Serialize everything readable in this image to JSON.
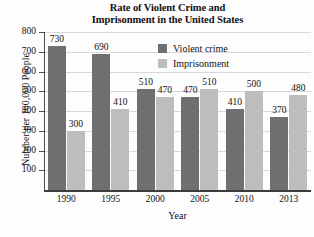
{
  "chart_data": {
    "type": "bar",
    "title": "Rate of Violent Crime and Imprisonment in the United States",
    "title_line1": "Rate of Violent Crime and",
    "title_line2": "Imprisonment in the United States",
    "xlabel": "Year",
    "ylabel": "Number per 100,000 People",
    "categories": [
      "1990",
      "1995",
      "2000",
      "2005",
      "2010",
      "2013"
    ],
    "series": [
      {
        "name": "Violent crime",
        "color": "#6f6f6f",
        "values": [
          730,
          690,
          510,
          470,
          410,
          370
        ]
      },
      {
        "name": "Imprisonment",
        "color": "#bdbdbd",
        "values": [
          300,
          410,
          470,
          510,
          500,
          480
        ]
      }
    ],
    "ylim": [
      0,
      800
    ],
    "yticks": [
      800,
      700,
      600,
      500,
      400,
      300,
      200,
      100
    ],
    "grid": true,
    "legend_position": "top-right"
  }
}
